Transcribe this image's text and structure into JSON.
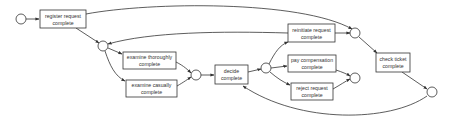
{
  "diagram": {
    "type": "petri-net",
    "colors": {
      "stroke": "#333333",
      "fill": "#ffffff",
      "text": "#333333",
      "background": "#ffffff"
    },
    "transitions": [
      {
        "id": "register",
        "lines": [
          "register request",
          "complete"
        ]
      },
      {
        "id": "examine_thoroughly",
        "lines": [
          "examine thoroughly",
          "complete"
        ]
      },
      {
        "id": "examine_casually",
        "lines": [
          "examine casually",
          "complete"
        ]
      },
      {
        "id": "decide",
        "lines": [
          "decide",
          "complete"
        ]
      },
      {
        "id": "reinitiate",
        "lines": [
          "reinitiate request",
          "complete"
        ]
      },
      {
        "id": "pay",
        "lines": [
          "pay compensation",
          "complete"
        ]
      },
      {
        "id": "reject",
        "lines": [
          "reject request",
          "complete"
        ]
      },
      {
        "id": "check_ticket",
        "lines": [
          "check ticket",
          "complete"
        ]
      }
    ],
    "places": [
      {
        "id": "start"
      },
      {
        "id": "p1"
      },
      {
        "id": "p2"
      },
      {
        "id": "p3"
      },
      {
        "id": "p4"
      },
      {
        "id": "p5"
      },
      {
        "id": "end"
      }
    ]
  }
}
